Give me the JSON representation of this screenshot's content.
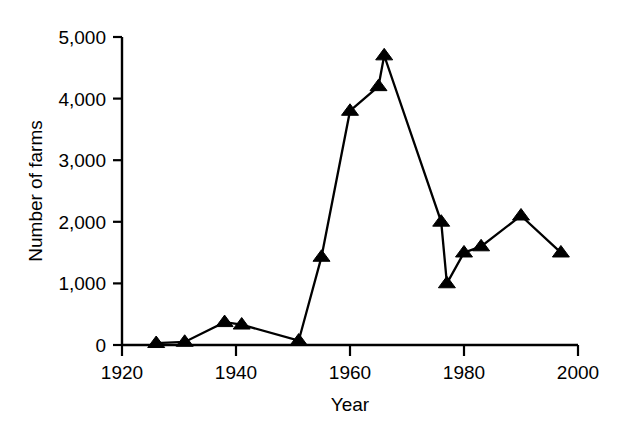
{
  "chart_data": {
    "type": "line",
    "title": "",
    "subtitle": "",
    "xlabel": "Year",
    "ylabel": "Number of farms",
    "xlim": [
      1920,
      2000
    ],
    "ylim": [
      0,
      5000
    ],
    "grid": false,
    "legend": null,
    "marker": "triangle-up",
    "series_color": "#000000",
    "x_tick_labels": [
      "1920",
      "1940",
      "1960",
      "1980",
      "2000"
    ],
    "x_ticks": [
      1920,
      1940,
      1960,
      1980,
      2000
    ],
    "y_tick_labels": [
      "0",
      "1,000",
      "2,000",
      "3,000",
      "4,000",
      "5,000"
    ],
    "y_ticks": [
      0,
      1000,
      2000,
      3000,
      4000,
      5000
    ],
    "x": [
      1926,
      1931,
      1938,
      1941,
      1951,
      1955,
      1960,
      1965,
      1966,
      1976,
      1977,
      1980,
      1983,
      1990,
      1997
    ],
    "values": [
      30,
      50,
      370,
      330,
      70,
      1430,
      3800,
      4200,
      4700,
      2000,
      1000,
      1500,
      1600,
      2100,
      1500
    ],
    "points": [
      {
        "x": 1926,
        "y": 30
      },
      {
        "x": 1931,
        "y": 50
      },
      {
        "x": 1938,
        "y": 370
      },
      {
        "x": 1941,
        "y": 330
      },
      {
        "x": 1951,
        "y": 70
      },
      {
        "x": 1955,
        "y": 1430
      },
      {
        "x": 1960,
        "y": 3800
      },
      {
        "x": 1965,
        "y": 4200
      },
      {
        "x": 1966,
        "y": 4700
      },
      {
        "x": 1976,
        "y": 2000
      },
      {
        "x": 1977,
        "y": 1000
      },
      {
        "x": 1980,
        "y": 1500
      },
      {
        "x": 1983,
        "y": 1600
      },
      {
        "x": 1990,
        "y": 2100
      },
      {
        "x": 1997,
        "y": 1500
      }
    ]
  },
  "axes": {
    "y_title": "Number of farms",
    "x_title": "Year"
  }
}
